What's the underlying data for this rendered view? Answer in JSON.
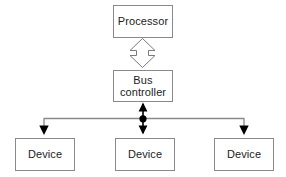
{
  "diagram": {
    "colors": {
      "box_border": "#8a8a8a",
      "box_fill": "#ffffff",
      "text": "#1c1c1c",
      "bus_line": "#8a8a8a",
      "arrow_solid": "#000000",
      "arrow_hollow_stroke": "#7a7a7a",
      "arrow_hollow_fill": "#ffffff",
      "junction_dot": "#000000",
      "background": "#ffffff"
    },
    "nodes": [
      {
        "id": "processor",
        "label": "Processor"
      },
      {
        "id": "bus-controller",
        "label": "Bus\ncontroller"
      },
      {
        "id": "device-0",
        "label": "Device"
      },
      {
        "id": "device-1",
        "label": "Device"
      },
      {
        "id": "device-2",
        "label": "Device"
      }
    ],
    "connectors": [
      {
        "id": "processor-bus-link",
        "kind": "hollow-double-arrow",
        "from": "processor",
        "to": "bus-controller",
        "bidirectional": true
      },
      {
        "id": "bus-trunk-link",
        "kind": "solid-double-arrow",
        "from": "bus-controller",
        "to": "bus-line",
        "bidirectional": true
      },
      {
        "id": "bus-line",
        "kind": "horizontal-bus",
        "from": "junction",
        "to": "devices"
      },
      {
        "id": "bus-device-0-link",
        "kind": "solid-arrow",
        "from": "bus-line",
        "to": "device-0"
      },
      {
        "id": "bus-device-1-link",
        "kind": "solid-arrow",
        "from": "bus-line",
        "to": "device-1"
      },
      {
        "id": "bus-device-2-link",
        "kind": "solid-arrow",
        "from": "bus-line",
        "to": "device-2"
      }
    ],
    "junction": {
      "id": "bus-junction-dot",
      "x": 143,
      "y": 119
    }
  }
}
